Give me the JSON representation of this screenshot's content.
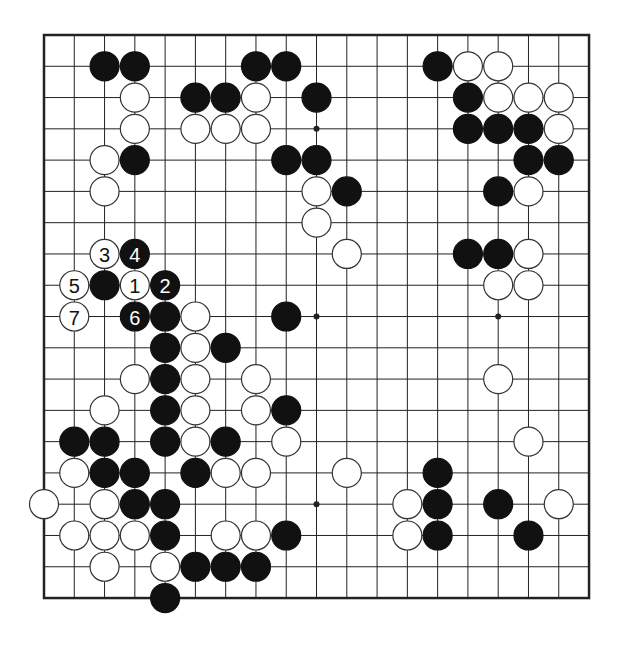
{
  "board": {
    "size": 19,
    "origin_x": 44,
    "origin_y": 35,
    "step_x": 30.28,
    "step_y": 31.28,
    "stone_radius": 14.5,
    "colors": {
      "black": "#111111",
      "white": "#ffffff",
      "line": "#222222"
    },
    "star_points": [
      [
        3,
        3
      ],
      [
        9,
        3
      ],
      [
        15,
        3
      ],
      [
        3,
        9
      ],
      [
        9,
        9
      ],
      [
        15,
        9
      ],
      [
        3,
        15
      ],
      [
        9,
        15
      ],
      [
        15,
        15
      ]
    ],
    "stones": [
      {
        "c": "B",
        "x": 2,
        "y": 1
      },
      {
        "c": "B",
        "x": 3,
        "y": 1
      },
      {
        "c": "B",
        "x": 7,
        "y": 1
      },
      {
        "c": "B",
        "x": 8,
        "y": 1
      },
      {
        "c": "B",
        "x": 13,
        "y": 1
      },
      {
        "c": "W",
        "x": 14,
        "y": 1
      },
      {
        "c": "W",
        "x": 15,
        "y": 1
      },
      {
        "c": "W",
        "x": 3,
        "y": 2
      },
      {
        "c": "B",
        "x": 5,
        "y": 2
      },
      {
        "c": "B",
        "x": 6,
        "y": 2
      },
      {
        "c": "W",
        "x": 7,
        "y": 2
      },
      {
        "c": "B",
        "x": 9,
        "y": 2
      },
      {
        "c": "B",
        "x": 14,
        "y": 2
      },
      {
        "c": "W",
        "x": 15,
        "y": 2
      },
      {
        "c": "W",
        "x": 16,
        "y": 2
      },
      {
        "c": "W",
        "x": 17,
        "y": 2
      },
      {
        "c": "W",
        "x": 3,
        "y": 3
      },
      {
        "c": "W",
        "x": 5,
        "y": 3
      },
      {
        "c": "W",
        "x": 6,
        "y": 3
      },
      {
        "c": "W",
        "x": 7,
        "y": 3
      },
      {
        "c": "B",
        "x": 14,
        "y": 3
      },
      {
        "c": "B",
        "x": 15,
        "y": 3
      },
      {
        "c": "B",
        "x": 16,
        "y": 3
      },
      {
        "c": "W",
        "x": 17,
        "y": 3
      },
      {
        "c": "W",
        "x": 2,
        "y": 4
      },
      {
        "c": "B",
        "x": 3,
        "y": 4
      },
      {
        "c": "B",
        "x": 8,
        "y": 4
      },
      {
        "c": "B",
        "x": 9,
        "y": 4
      },
      {
        "c": "B",
        "x": 16,
        "y": 4
      },
      {
        "c": "B",
        "x": 17,
        "y": 4
      },
      {
        "c": "W",
        "x": 2,
        "y": 5
      },
      {
        "c": "W",
        "x": 9,
        "y": 5
      },
      {
        "c": "B",
        "x": 10,
        "y": 5
      },
      {
        "c": "B",
        "x": 15,
        "y": 5
      },
      {
        "c": "W",
        "x": 16,
        "y": 5
      },
      {
        "c": "W",
        "x": 9,
        "y": 6
      },
      {
        "c": "W",
        "x": 2,
        "y": 7,
        "label": "3"
      },
      {
        "c": "B",
        "x": 3,
        "y": 7,
        "label": "4"
      },
      {
        "c": "W",
        "x": 10,
        "y": 7
      },
      {
        "c": "B",
        "x": 14,
        "y": 7
      },
      {
        "c": "B",
        "x": 15,
        "y": 7
      },
      {
        "c": "W",
        "x": 16,
        "y": 7
      },
      {
        "c": "W",
        "x": 1,
        "y": 8,
        "label": "5"
      },
      {
        "c": "B",
        "x": 2,
        "y": 8
      },
      {
        "c": "W",
        "x": 3,
        "y": 8,
        "label": "1"
      },
      {
        "c": "B",
        "x": 4,
        "y": 8,
        "label": "2"
      },
      {
        "c": "W",
        "x": 15,
        "y": 8
      },
      {
        "c": "W",
        "x": 16,
        "y": 8
      },
      {
        "c": "W",
        "x": 1,
        "y": 9,
        "label": "7"
      },
      {
        "c": "B",
        "x": 3,
        "y": 9,
        "label": "6"
      },
      {
        "c": "B",
        "x": 4,
        "y": 9
      },
      {
        "c": "W",
        "x": 5,
        "y": 9
      },
      {
        "c": "B",
        "x": 8,
        "y": 9
      },
      {
        "c": "B",
        "x": 4,
        "y": 10
      },
      {
        "c": "W",
        "x": 5,
        "y": 10
      },
      {
        "c": "B",
        "x": 6,
        "y": 10
      },
      {
        "c": "W",
        "x": 3,
        "y": 11
      },
      {
        "c": "B",
        "x": 4,
        "y": 11
      },
      {
        "c": "W",
        "x": 5,
        "y": 11
      },
      {
        "c": "W",
        "x": 7,
        "y": 11
      },
      {
        "c": "W",
        "x": 15,
        "y": 11
      },
      {
        "c": "W",
        "x": 2,
        "y": 12
      },
      {
        "c": "B",
        "x": 4,
        "y": 12
      },
      {
        "c": "W",
        "x": 5,
        "y": 12
      },
      {
        "c": "W",
        "x": 7,
        "y": 12
      },
      {
        "c": "B",
        "x": 8,
        "y": 12
      },
      {
        "c": "B",
        "x": 1,
        "y": 13
      },
      {
        "c": "B",
        "x": 2,
        "y": 13
      },
      {
        "c": "B",
        "x": 4,
        "y": 13
      },
      {
        "c": "W",
        "x": 5,
        "y": 13
      },
      {
        "c": "B",
        "x": 6,
        "y": 13
      },
      {
        "c": "W",
        "x": 8,
        "y": 13
      },
      {
        "c": "W",
        "x": 16,
        "y": 13
      },
      {
        "c": "W",
        "x": 1,
        "y": 14
      },
      {
        "c": "B",
        "x": 2,
        "y": 14
      },
      {
        "c": "B",
        "x": 3,
        "y": 14
      },
      {
        "c": "B",
        "x": 5,
        "y": 14
      },
      {
        "c": "W",
        "x": 6,
        "y": 14
      },
      {
        "c": "W",
        "x": 7,
        "y": 14
      },
      {
        "c": "W",
        "x": 10,
        "y": 14
      },
      {
        "c": "B",
        "x": 13,
        "y": 14
      },
      {
        "c": "W",
        "x": 0,
        "y": 15
      },
      {
        "c": "W",
        "x": 2,
        "y": 15
      },
      {
        "c": "B",
        "x": 3,
        "y": 15
      },
      {
        "c": "B",
        "x": 4,
        "y": 15
      },
      {
        "c": "W",
        "x": 12,
        "y": 15
      },
      {
        "c": "B",
        "x": 13,
        "y": 15
      },
      {
        "c": "B",
        "x": 15,
        "y": 15
      },
      {
        "c": "W",
        "x": 17,
        "y": 15
      },
      {
        "c": "W",
        "x": 1,
        "y": 16
      },
      {
        "c": "W",
        "x": 2,
        "y": 16
      },
      {
        "c": "W",
        "x": 3,
        "y": 16
      },
      {
        "c": "B",
        "x": 4,
        "y": 16
      },
      {
        "c": "W",
        "x": 6,
        "y": 16
      },
      {
        "c": "W",
        "x": 7,
        "y": 16
      },
      {
        "c": "B",
        "x": 8,
        "y": 16
      },
      {
        "c": "W",
        "x": 12,
        "y": 16
      },
      {
        "c": "B",
        "x": 13,
        "y": 16
      },
      {
        "c": "B",
        "x": 16,
        "y": 16
      },
      {
        "c": "W",
        "x": 2,
        "y": 17
      },
      {
        "c": "W",
        "x": 4,
        "y": 17
      },
      {
        "c": "B",
        "x": 5,
        "y": 17
      },
      {
        "c": "B",
        "x": 6,
        "y": 17
      },
      {
        "c": "B",
        "x": 7,
        "y": 17
      },
      {
        "c": "B",
        "x": 4,
        "y": 18
      }
    ]
  }
}
